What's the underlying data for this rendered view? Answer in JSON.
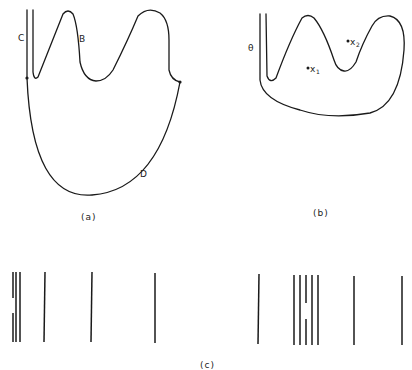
{
  "panel_a": {
    "caption": "(a)",
    "labels": {
      "C": "C",
      "B": "B",
      "D": "D"
    }
  },
  "panel_b": {
    "caption": "(b)",
    "labels": {
      "theta": "θ",
      "x1_base": "x",
      "x1_sub": "1",
      "x2_base": "x",
      "x2_sub": "2"
    }
  },
  "panel_c": {
    "caption": "(c)",
    "bars_left_x": [
      13,
      16,
      20,
      44,
      91,
      155
    ],
    "bars_right_x": [
      259,
      294,
      300,
      306,
      312,
      318,
      354,
      402
    ],
    "broken_bars": [
      {
        "x": 13,
        "segments": [
          [
            272,
            298
          ],
          [
            313,
            342
          ]
        ]
      },
      {
        "x": 306,
        "segments": [
          [
            275,
            303
          ],
          [
            319,
            344
          ]
        ]
      }
    ]
  }
}
